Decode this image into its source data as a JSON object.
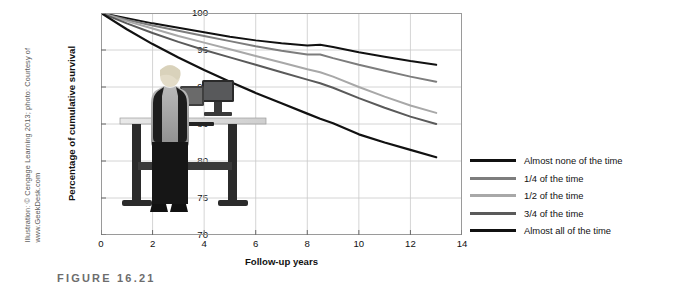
{
  "credit": "Illustration: © Cengage Learning 2013; photo: Courtesy of www.GeekDesk.com",
  "figure_caption": "FIGURE 16.21",
  "photo": {
    "alt": "Woman standing beside an adjustable-height standing desk with two monitors"
  },
  "chart_data": {
    "type": "line",
    "title": "",
    "xlabel": "Follow-up years",
    "ylabel": "Percentage of cumulative survival",
    "xlim": [
      0,
      14
    ],
    "ylim": [
      70,
      100
    ],
    "xticks": [
      0,
      2,
      4,
      6,
      8,
      10,
      12,
      14
    ],
    "xtick_labels": [
      "0",
      "2",
      "4",
      "6",
      "8",
      "10",
      "12",
      "14"
    ],
    "yticks": [
      70,
      75,
      80,
      85,
      90,
      95,
      100
    ],
    "ytick_labels": [
      "70",
      "75",
      "80",
      "85",
      "90",
      "95",
      "100"
    ],
    "grid": true,
    "legend_position": "right",
    "series": [
      {
        "name": "Almost none of the time",
        "color": "#111111",
        "width": 2.0,
        "x": [
          0,
          1,
          2,
          3,
          4,
          5,
          6,
          7,
          8,
          8.5,
          9,
          10,
          11,
          12,
          13
        ],
        "y": [
          100,
          99.3,
          98.6,
          98.0,
          97.4,
          96.8,
          96.3,
          95.9,
          95.6,
          95.7,
          95.4,
          94.7,
          94.1,
          93.5,
          93.0
        ]
      },
      {
        "name": "1/4 of the time",
        "color": "#7d7d7d",
        "width": 2.0,
        "x": [
          0,
          1,
          2,
          3,
          4,
          5,
          6,
          7,
          8,
          8.5,
          9,
          10,
          11,
          12,
          13
        ],
        "y": [
          100,
          99.1,
          98.3,
          97.6,
          96.9,
          96.2,
          95.5,
          94.9,
          94.4,
          94.4,
          93.9,
          93.0,
          92.2,
          91.4,
          90.7
        ]
      },
      {
        "name": "1/2 of the time",
        "color": "#a8a8a8",
        "width": 2.0,
        "x": [
          0,
          1,
          2,
          3,
          4,
          5,
          6,
          7,
          8,
          8.5,
          9,
          10,
          11,
          12,
          13
        ],
        "y": [
          100,
          98.9,
          97.9,
          96.9,
          96.0,
          95.1,
          94.2,
          93.3,
          92.4,
          92.0,
          91.4,
          90.0,
          88.7,
          87.5,
          86.5
        ]
      },
      {
        "name": "3/4 of the time",
        "color": "#5a5a5a",
        "width": 2.0,
        "x": [
          0,
          1,
          2,
          3,
          4,
          5,
          6,
          7,
          8,
          8.5,
          9,
          10,
          11,
          12,
          13
        ],
        "y": [
          100,
          98.6,
          97.3,
          96.1,
          95.0,
          94.0,
          93.0,
          92.0,
          91.0,
          90.5,
          89.9,
          88.5,
          87.2,
          86.0,
          85.0
        ]
      },
      {
        "name": "Almost all of the time",
        "color": "#111111",
        "width": 2.2,
        "x": [
          0,
          1,
          2,
          3,
          4,
          5,
          6,
          7,
          8,
          8.5,
          9,
          10,
          11,
          12,
          13
        ],
        "y": [
          100,
          97.8,
          95.8,
          94.0,
          92.3,
          90.7,
          89.2,
          87.8,
          86.4,
          85.7,
          85.1,
          83.6,
          82.5,
          81.5,
          80.5
        ]
      }
    ]
  }
}
